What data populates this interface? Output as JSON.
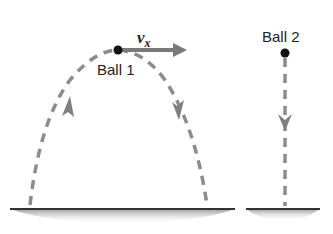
{
  "diagram": {
    "ball1": {
      "label": "Ball 1",
      "velocity_label": "v",
      "velocity_subscript": "x"
    },
    "ball2": {
      "label": "Ball 2"
    },
    "colors": {
      "path": "#8c8c8c",
      "arrow": "#7a7a7a",
      "ball": "#111111",
      "ground_line": "#333333",
      "ground_shade": "#b5b5b5"
    }
  }
}
